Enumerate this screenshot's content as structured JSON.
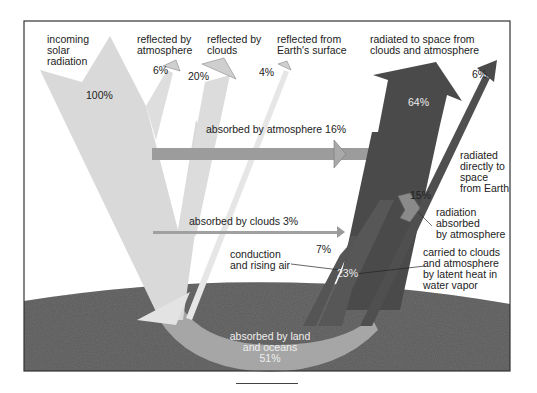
{
  "diagram": {
    "colors": {
      "incoming": "#d9d9d9",
      "absorbed_atmosphere": "#9c9c9c",
      "absorbed_clouds": "#a0a0a0",
      "outgoing_dark": "#4a4a4a",
      "ground": "#6e6e6e",
      "land_ocean_band": "#a6a6a6",
      "frame": "#333333"
    },
    "labels": {
      "incoming": "incoming\nsolar\nradiation",
      "reflected_atmosphere": "reflected by\natmosphere",
      "reflected_clouds": "reflected by\nclouds",
      "reflected_surface": "reflected from\nEarth's surface",
      "radiated_clouds_atm": "radiated to space from\nclouds and atmosphere",
      "absorbed_atmosphere": "absorbed by atmosphere 16%",
      "absorbed_clouds": "absorbed by clouds 3%",
      "radiated_directly": "radiated\ndirectly to\nspace\nfrom Earth",
      "radiation_absorbed": "radiation\nabsorbed\nby atmosphere",
      "conduction": "conduction\nand rising air",
      "latent_heat": "carried to clouds\nand atmosphere\nby latent heat in\nwater vapor",
      "land_oceans": "absorbed by land\nand oceans\n51%"
    },
    "values": {
      "incoming": "100%",
      "reflected_atmosphere": "6%",
      "reflected_clouds": "20%",
      "reflected_surface": "4%",
      "radiated_clouds_atm": "64%",
      "radiated_directly": "6%",
      "radiation_absorbed": "15%",
      "conduction": "7%",
      "latent_heat": "23%"
    }
  }
}
